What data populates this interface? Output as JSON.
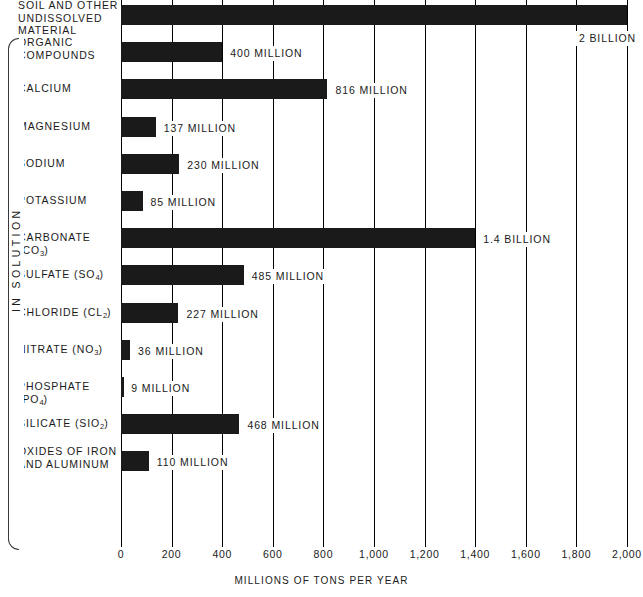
{
  "chart_data": {
    "type": "bar",
    "orientation": "horizontal",
    "title": "",
    "xlabel": "MILLIONS OF TONS PER YEAR",
    "ylabel": "",
    "xlim": [
      0,
      2000
    ],
    "xticks": [
      0,
      200,
      400,
      600,
      800,
      1000,
      1200,
      1400,
      1600,
      1800,
      2000
    ],
    "xtick_labels": [
      "0",
      "200",
      "400",
      "600",
      "800",
      "1,000",
      "1,200",
      "1,400",
      "1,600",
      "1,800",
      "2,000"
    ],
    "grid": true,
    "legend": "none",
    "units": "millions of tons per year",
    "categories": [
      "SOIL AND OTHER UNDISSOLVED MATERIAL",
      "ORGANIC COMPOUNDS",
      "CALCIUM",
      "MAGNESIUM",
      "SODIUM",
      "POTASSIUM",
      "CARBONATE (CO3)",
      "SULFATE (SO4)",
      "CHLORIDE (Cl2)",
      "NITRATE (NO3)",
      "PHOSPHATE (PO4)",
      "SILICATE (SiO2)",
      "OXIDES OF IRON AND ALUMINUM"
    ],
    "values": [
      2000,
      400,
      816,
      137,
      230,
      85,
      1400,
      485,
      227,
      36,
      9,
      468,
      110
    ],
    "value_labels": [
      "2 BILLION",
      "400 MILLION",
      "816 MILLION",
      "137 MILLION",
      "230 MILLION",
      "85 MILLION",
      "1.4 BILLION",
      "485 MILLION",
      "227 MILLION",
      "36 MILLION",
      "9 MILLION",
      "468 MILLION",
      "110 MILLION"
    ],
    "group_annotation": "IN SOLUTION",
    "group_annotation_members": [
      "ORGANIC COMPOUNDS",
      "CALCIUM",
      "MAGNESIUM",
      "SODIUM",
      "POTASSIUM",
      "CARBONATE (CO3)",
      "SULFATE (SO4)",
      "CHLORIDE (Cl2)",
      "NITRATE (NO3)",
      "PHOSPHATE (PO4)",
      "SILICATE (SiO2)",
      "OXIDES OF IRON AND ALUMINUM"
    ]
  },
  "rows": [
    {
      "label_line1": "SOIL AND OTHER",
      "label_line2": "UNDISSOLVED MATERIAL",
      "formula_base": "",
      "formula_sub": "",
      "formula_tail": "",
      "value_label": "2 BILLION",
      "value": 2000
    },
    {
      "label_line1": "ORGANIC",
      "label_line2": "COMPOUNDS",
      "formula_base": "",
      "formula_sub": "",
      "formula_tail": "",
      "value_label": "400 MILLION",
      "value": 400
    },
    {
      "label_line1": "CALCIUM",
      "label_line2": "",
      "formula_base": "",
      "formula_sub": "",
      "formula_tail": "",
      "value_label": "816 MILLION",
      "value": 816
    },
    {
      "label_line1": "MAGNESIUM",
      "label_line2": "",
      "formula_base": "",
      "formula_sub": "",
      "formula_tail": "",
      "value_label": "137 MILLION",
      "value": 137
    },
    {
      "label_line1": "SODIUM",
      "label_line2": "",
      "formula_base": "",
      "formula_sub": "",
      "formula_tail": "",
      "value_label": "230 MILLION",
      "value": 230
    },
    {
      "label_line1": "POTASSIUM",
      "label_line2": "",
      "formula_base": "",
      "formula_sub": "",
      "formula_tail": "",
      "value_label": "85 MILLION",
      "value": 85
    },
    {
      "label_line1": "CARBONATE  (CO",
      "label_line2": "",
      "formula_base": "",
      "formula_sub": "3",
      "formula_tail": ")",
      "value_label": "1.4 BILLION",
      "value": 1400
    },
    {
      "label_line1": "SULFATE  (SO",
      "label_line2": "",
      "formula_base": "",
      "formula_sub": "4",
      "formula_tail": ")",
      "value_label": "485 MILLION",
      "value": 485
    },
    {
      "label_line1": "CHLORIDE  (Cl",
      "label_line2": "",
      "formula_base": "",
      "formula_sub": "2",
      "formula_tail": ")",
      "value_label": "227 MILLION",
      "value": 227
    },
    {
      "label_line1": "NITRATE  (NO",
      "label_line2": "",
      "formula_base": "",
      "formula_sub": "3",
      "formula_tail": ")",
      "value_label": "36 MILLION",
      "value": 36
    },
    {
      "label_line1": "PHOSPHATE  (PO",
      "label_line2": "",
      "formula_base": "",
      "formula_sub": "4",
      "formula_tail": ")",
      "value_label": "9 MILLION",
      "value": 9
    },
    {
      "label_line1": "SILICATE  (SiO",
      "label_line2": "",
      "formula_base": "",
      "formula_sub": "2",
      "formula_tail": ")",
      "value_label": "468 MILLION",
      "value": 468
    },
    {
      "label_line1": "OXIDES OF IRON",
      "label_line2": "AND ALUMINUM",
      "formula_base": "",
      "formula_sub": "",
      "formula_tail": "",
      "value_label": "110 MILLION",
      "value": 110
    }
  ],
  "axis": {
    "title": "MILLIONS OF TONS PER YEAR",
    "ticks": [
      "0",
      "200",
      "400",
      "600",
      "800",
      "1,000",
      "1,200",
      "1,400",
      "1,600",
      "1,800",
      "2,000"
    ]
  },
  "group": {
    "label": "IN SOLUTION"
  },
  "colors": {
    "bar": "#1a1a1a",
    "grid": "#000000",
    "text": "#1a1a1a",
    "background": "#ffffff"
  }
}
